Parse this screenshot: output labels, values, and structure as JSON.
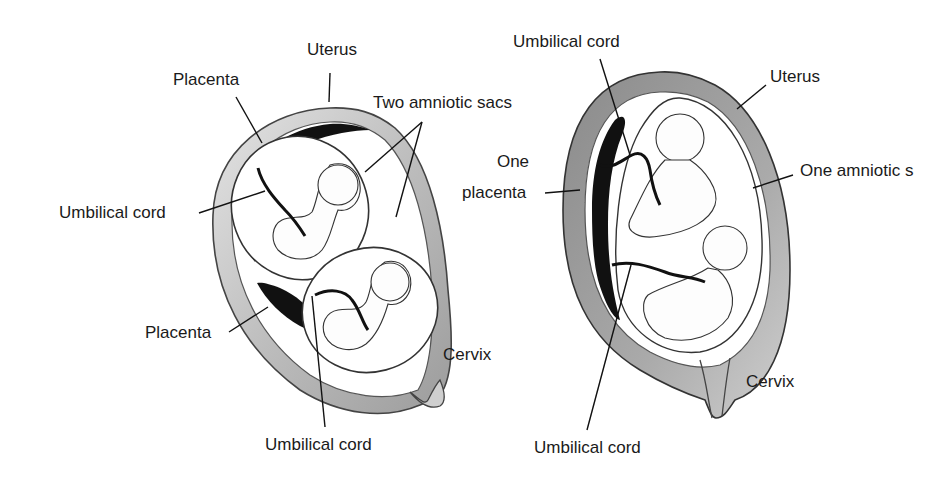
{
  "diagrams": [
    {
      "id": "dichorionic",
      "labels": {
        "uterus": "Uterus",
        "placenta_top": "Placenta",
        "two_amniotic_sacs": "Two amniotic sacs",
        "umbilical_cord_left": "Umbilical cord",
        "placenta_bottom": "Placenta",
        "cervix": "Cervix",
        "umbilical_cord_bottom": "Umbilical cord"
      }
    },
    {
      "id": "monochorionic",
      "labels": {
        "umbilical_cord_top": "Umbilical cord",
        "uterus": "Uterus",
        "one_placenta_line1": "One",
        "one_placenta_line2": "placenta",
        "one_amniotic_sac": "One amniotic s",
        "cervix": "Cervix",
        "umbilical_cord_bottom": "Umbilical cord"
      }
    }
  ],
  "colors": {
    "ink": "#1a1a1a",
    "uterus_wall": "#9a9a9a",
    "uterus_wall_light": "#d6d6d6",
    "placenta": "#111111",
    "background": "#ffffff"
  }
}
